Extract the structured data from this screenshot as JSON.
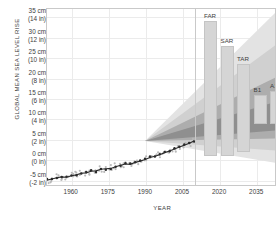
{
  "chart_data": {
    "type": "area",
    "title": "",
    "ylabel": "GLOBAL MEAN SEA LEVEL RISE",
    "xlabel": "YEAR",
    "xlim": [
      1950,
      2043
    ],
    "ylim": [
      -6.5,
      37
    ],
    "grid": true,
    "legend_position": "none",
    "y_ticks": [
      {
        "cm": "35 cm",
        "in": "(14 in)",
        "value": 35
      },
      {
        "cm": "30 cm",
        "in": "(12 in)",
        "value": 30
      },
      {
        "cm": "25 cm",
        "in": "(10 in)",
        "value": 25
      },
      {
        "cm": "20 cm",
        "in": "(8 in)",
        "value": 20
      },
      {
        "cm": "15 cm",
        "in": "(6 in)",
        "value": 15
      },
      {
        "cm": "10 cm",
        "in": "(4 in)",
        "value": 10
      },
      {
        "cm": "5 cm",
        "in": "(2 in)",
        "value": 5
      },
      {
        "cm": "0 cm",
        "in": "(0 in)",
        "value": 0
      },
      {
        "cm": "-5 cm",
        "in": "(-2 in)",
        "value": -5
      }
    ],
    "x_ticks": [
      {
        "label": "1960",
        "value": 1960
      },
      {
        "label": "1975",
        "value": 1975
      },
      {
        "label": "1990",
        "value": 1990
      },
      {
        "label": "2005",
        "value": 2005
      },
      {
        "label": "2020",
        "value": 2020
      },
      {
        "label": "2035",
        "value": 2035
      }
    ],
    "observations": {
      "name": "Observed global mean sea level",
      "x": [
        1950,
        1952,
        1954,
        1956,
        1958,
        1960,
        1962,
        1964,
        1966,
        1968,
        1970,
        1972,
        1974,
        1976,
        1978,
        1980,
        1982,
        1984,
        1986,
        1988,
        1990,
        1992,
        1994,
        1996,
        1998,
        2000,
        2002,
        2004,
        2006,
        2008,
        2010
      ],
      "y": [
        -5.3,
        -5.0,
        -4.7,
        -4.5,
        -4.6,
        -4.2,
        -4.0,
        -3.6,
        -3.5,
        -3.1,
        -3.0,
        -2.6,
        -2.5,
        -2.4,
        -2.0,
        -1.6,
        -1.3,
        -1.4,
        -0.9,
        -0.6,
        -0.2,
        0.3,
        0.6,
        1.0,
        1.5,
        1.9,
        2.4,
        2.9,
        3.3,
        3.8,
        4.4
      ]
    },
    "projection_bands": [
      {
        "name": "outer-range",
        "start_year": 1990,
        "end_year": 2043,
        "end_low": -1.0,
        "end_high": 36.0,
        "color": "#e3e3e3"
      },
      {
        "name": "mid-range",
        "start_year": 1990,
        "end_year": 2043,
        "end_low": 2.0,
        "end_high": 28.0,
        "color": "#d0d0d0"
      },
      {
        "name": "inner-range",
        "start_year": 1990,
        "end_year": 2043,
        "end_low": 5.0,
        "end_high": 20.0,
        "color": "#adadad"
      },
      {
        "name": "core-range",
        "start_year": 1990,
        "end_year": 2043,
        "end_low": 7.0,
        "end_high": 14.0,
        "color": "#8f8f8f"
      }
    ],
    "projection_bars": {
      "note": "Assessment / scenario ranges shown as vertical bars at right",
      "bars": [
        {
          "label": "FAR",
          "top": 34.0,
          "bottom": 1.0
        },
        {
          "label": "SAR",
          "top": 28.0,
          "bottom": 1.0
        },
        {
          "label": "TAR",
          "top": 23.5,
          "bottom": 2.0
        },
        {
          "label": "B1",
          "top": 16.0,
          "bottom": 9.0
        },
        {
          "label": "A1B",
          "top": 17.0,
          "bottom": 9.0
        },
        {
          "label": "A2",
          "top": 17.5,
          "bottom": 9.0
        }
      ]
    }
  }
}
